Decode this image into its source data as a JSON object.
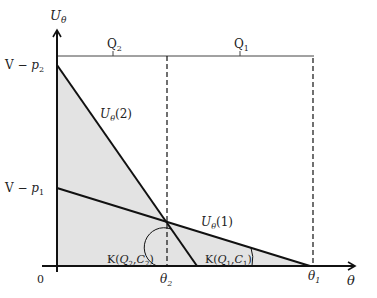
{
  "diagram": {
    "y_axis_label": "U",
    "y_axis_sub": "θ",
    "x_axis_label": "θ",
    "origin_label": "0",
    "bracket_labels": {
      "q2": {
        "main": "Q",
        "sub": "2"
      },
      "q1": {
        "main": "Q",
        "sub": "1"
      }
    },
    "y_ticks": [
      {
        "id": "v_minus_p2",
        "prefix": "V − ",
        "var": "p",
        "sub": "2"
      },
      {
        "id": "v_minus_p1",
        "prefix": "V − ",
        "var": "p",
        "sub": "1"
      }
    ],
    "x_ticks": [
      {
        "id": "theta2",
        "var": "θ",
        "sub": "2"
      },
      {
        "id": "theta1",
        "var": "θ",
        "sub": "1"
      }
    ],
    "curves": [
      {
        "id": "u_theta_2",
        "var": "U",
        "sub": "θ",
        "arg": "(2)"
      },
      {
        "id": "u_theta_1",
        "var": "U",
        "sub": "θ",
        "arg": "(1)"
      }
    ],
    "angle_labels": [
      {
        "id": "k_q2_c2",
        "text_pre": "K(",
        "q": "Q",
        "q_sub": "2",
        "sep": ",",
        "c": "C",
        "c_sub": "2",
        "text_post": ")"
      },
      {
        "id": "k_q1_c1",
        "text_pre": "K(",
        "q": "Q",
        "q_sub": "1",
        "sep": ",",
        "c": "C",
        "c_sub": "1",
        "text_post": ")"
      }
    ],
    "colors": {
      "shade": "#e3e3e3",
      "line": "#111111",
      "text": "#222222"
    }
  }
}
